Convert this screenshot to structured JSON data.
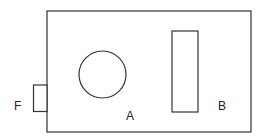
{
  "diagram": {
    "labels": {
      "circle": "A",
      "rectangle": "B",
      "tab": "F"
    },
    "stroke_color": "#333333",
    "background": "#ffffff"
  }
}
